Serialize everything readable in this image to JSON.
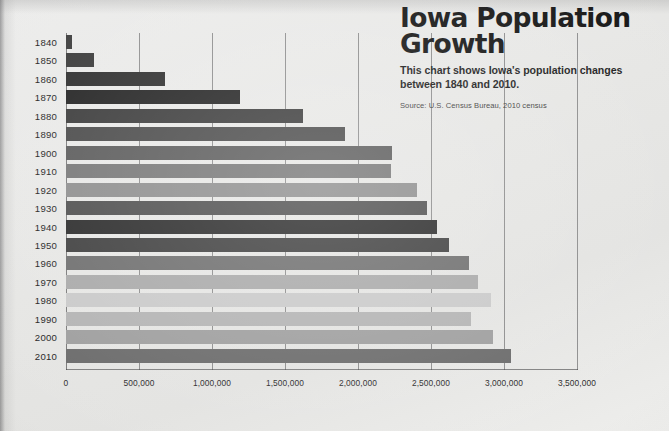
{
  "header": {
    "title": "Iowa Population Growth",
    "subtitle": "This chart shows Iowa's population changes between 1840 and 2010.",
    "source": "Source: U.S. Census Bureau, 2010 census"
  },
  "chart_data": {
    "type": "bar",
    "orientation": "horizontal",
    "title": "Iowa Population Growth",
    "subtitle": "This chart shows Iowa's population changes between 1840 and 2010.",
    "source": "Source: U.S. Census Bureau, 2010 census",
    "xlabel": "",
    "ylabel": "",
    "xlim": [
      0,
      3500000
    ],
    "xticks": [
      0,
      500000,
      1000000,
      1500000,
      2000000,
      2500000,
      3000000,
      3500000
    ],
    "xtick_labels": [
      "0",
      "500,000",
      "1,000,000",
      "1,500,000",
      "2,000,000",
      "2,500,000",
      "3,000,000",
      "3,500,000"
    ],
    "grid": true,
    "grid_axis": "x",
    "legend": false,
    "categories": [
      "1840",
      "1850",
      "1860",
      "1870",
      "1880",
      "1890",
      "1900",
      "1910",
      "1920",
      "1930",
      "1940",
      "1950",
      "1960",
      "1970",
      "1980",
      "1990",
      "2000",
      "2010"
    ],
    "values": [
      43112,
      192214,
      674913,
      1194020,
      1624615,
      1912297,
      2231853,
      2224771,
      2404021,
      2470939,
      2538268,
      2621073,
      2757537,
      2824376,
      2913808,
      2776755,
      2926324,
      3046355
    ],
    "bar_colors": [
      "#3c3c3c",
      "#3a3a3a",
      "#2e2e2e",
      "#232323",
      "#3b3b3b",
      "#4a4a4a",
      "#5b5b5b",
      "#777777",
      "#8e8e8e",
      "#4f4f4f",
      "#2b2b2b",
      "#3f3f3f",
      "#6e6e6e",
      "#a9a9a9",
      "#c9c9c9",
      "#b3b3b3",
      "#9e9e9e",
      "#6a6a6a"
    ]
  },
  "colors": {
    "background": "#e8e8e6",
    "text": "#1d1d1d",
    "gridline": "#3c3c3e"
  }
}
